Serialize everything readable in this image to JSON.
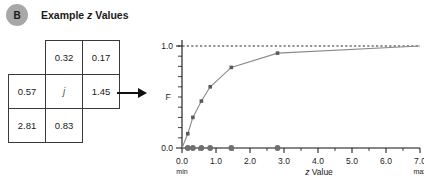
{
  "panel": {
    "badge_letter": "B",
    "title_prefix": "Example ",
    "title_italic": "z",
    "title_suffix": " Values",
    "badge_color": "#a8a8a8"
  },
  "value_grid": {
    "name": "z-value-neighborhood-grid",
    "rows": [
      [
        {
          "value": "",
          "present": false
        },
        {
          "value": "0.32",
          "present": true
        },
        {
          "value": "0.17",
          "present": true
        }
      ],
      [
        {
          "value": "0.57",
          "present": true
        },
        {
          "value": "j",
          "present": true,
          "center": true
        },
        {
          "value": "1.45",
          "present": true
        }
      ],
      [
        {
          "value": "2.81",
          "present": true
        },
        {
          "value": "0.83",
          "present": true
        },
        {
          "value": "",
          "present": false
        }
      ]
    ]
  },
  "arrow": {
    "name": "flow-arrow",
    "direction": "right"
  },
  "chart_data": {
    "type": "line",
    "title": "",
    "xlabel": "z Value",
    "xlabel_italic": "z",
    "xlabel_rest": " Value",
    "ylabel": "F",
    "xlim": [
      0.0,
      7.0
    ],
    "ylim": [
      0.0,
      1.0
    ],
    "grid": false,
    "legend": null,
    "x_ticks": [
      "0.0",
      "1.0",
      "2.0",
      "3.0",
      "4.0",
      "5.0",
      "6.0",
      "7.0"
    ],
    "x_tick_values": [
      0.0,
      1.0,
      2.0,
      3.0,
      4.0,
      5.0,
      6.0,
      7.0
    ],
    "x_tick_sublabels": {
      "left": "min",
      "right": "max"
    },
    "y_ticks": [
      "0.0",
      "1.0"
    ],
    "y_tick_values": [
      0.0,
      1.0
    ],
    "y_minor_count": 10,
    "annotations": [
      {
        "name": "asymptote-dashed-line",
        "type": "hline",
        "y": 1.0,
        "style": "dashed"
      }
    ],
    "series": [
      {
        "name": "empirical-cdf-curve",
        "x": [
          0.0,
          0.17,
          0.32,
          0.57,
          0.83,
          1.45,
          2.81,
          7.0
        ],
        "values": [
          0.0,
          0.14,
          0.3,
          0.46,
          0.6,
          0.79,
          0.93,
          1.0
        ],
        "marker": "square",
        "color": "#8a8a8a"
      },
      {
        "name": "rug-observations",
        "x": [
          0.17,
          0.32,
          0.57,
          0.83,
          1.45,
          2.81
        ],
        "values": [
          0.0,
          0.0,
          0.0,
          0.0,
          0.0,
          0.0
        ],
        "marker": "circle",
        "color": "#6f6f6f"
      }
    ]
  }
}
